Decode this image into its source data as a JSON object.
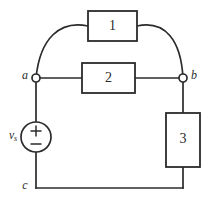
{
  "figure": {
    "kind": "electrical-circuit-schematic",
    "stroke_color": "#2b2b2b",
    "background_color": "#ffffff",
    "fill_color": "#ffffff"
  },
  "elements": {
    "box1": {
      "label": "1",
      "orientation": "horizontal"
    },
    "box2": {
      "label": "2",
      "orientation": "horizontal"
    },
    "box3": {
      "label": "3",
      "orientation": "vertical"
    }
  },
  "nodes": {
    "a": {
      "label": "a",
      "marker": "open-circle"
    },
    "b": {
      "label": "b",
      "marker": "open-circle"
    },
    "c": {
      "label": "c",
      "marker": "none"
    }
  },
  "source": {
    "symbol": "independent-voltage-source",
    "label_main": "v",
    "label_sub": "s",
    "plus_sign": "+",
    "minus_sign": "−",
    "polarity_top": "+",
    "polarity_bottom": "−"
  }
}
